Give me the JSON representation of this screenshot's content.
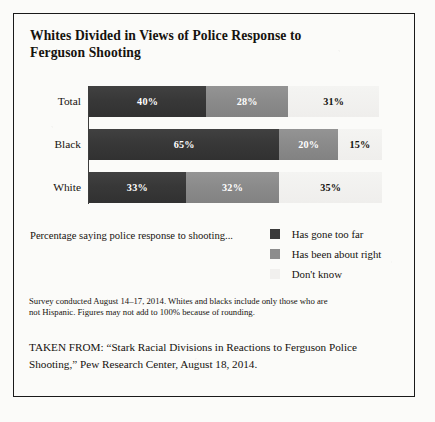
{
  "figure": {
    "title_line1": "Whites Divided in Views of Police Response to",
    "title_line2": "Ferguson Shooting"
  },
  "legend": {
    "caption": "Percentage saying police response to shooting...",
    "items": [
      {
        "label": "Has gone too far",
        "swatch": "dark-gray-swatch-icon",
        "color": "#3a3a3a"
      },
      {
        "label": "Has been about right",
        "swatch": "mid-gray-swatch-icon",
        "color": "#8d8d8d"
      },
      {
        "label": "Don't know",
        "swatch": "light-gray-swatch-icon",
        "color": "#f1f0ee"
      }
    ]
  },
  "notes": {
    "survey_line1": "Survey conducted August 14–17, 2014. Whites and blacks include only those who are",
    "survey_line2": "not Hispanic. Figures may not add to 100% because of rounding.",
    "taken_from_line1": "TAKEN FROM: “Stark Racial Divisions in Reactions to Ferguson Police",
    "taken_from_line2": "Shooting,” Pew Research Center, August 18, 2014."
  },
  "chart_data": {
    "type": "bar",
    "orientation": "horizontal",
    "stacked": true,
    "title": "Whites Divided in Views of Police Response to Ferguson Shooting",
    "xlabel": "",
    "ylabel": "",
    "xlim": [
      0,
      100
    ],
    "grid": false,
    "legend_position": "bottom-right",
    "categories": [
      "Total",
      "Black",
      "White"
    ],
    "series": [
      {
        "name": "Has gone too far",
        "color": "#3a3a3a",
        "values": [
          40,
          65,
          33
        ],
        "labels": [
          "40%",
          "65%",
          "33%"
        ]
      },
      {
        "name": "Has been about right",
        "color": "#8d8d8d",
        "values": [
          28,
          20,
          32
        ],
        "labels": [
          "28%",
          "20%",
          "32%"
        ]
      },
      {
        "name": "Don't know",
        "color": "#f1f0ee",
        "values": [
          31,
          15,
          35
        ],
        "labels": [
          "31%",
          "15%",
          "35%"
        ]
      }
    ],
    "rows": [
      {
        "category": "Total",
        "segments": [
          {
            "series": "Has gone too far",
            "value": 40,
            "label": "40%"
          },
          {
            "series": "Has been about right",
            "value": 28,
            "label": "28%"
          },
          {
            "series": "Don't know",
            "value": 31,
            "label": "31%"
          }
        ]
      },
      {
        "category": "Black",
        "segments": [
          {
            "series": "Has gone too far",
            "value": 65,
            "label": "65%"
          },
          {
            "series": "Has been about right",
            "value": 20,
            "label": "20%"
          },
          {
            "series": "Don't know",
            "value": 15,
            "label": "15%"
          }
        ]
      },
      {
        "category": "White",
        "segments": [
          {
            "series": "Has gone too far",
            "value": 33,
            "label": "33%"
          },
          {
            "series": "Has been about right",
            "value": 32,
            "label": "32%"
          },
          {
            "series": "Don't know",
            "value": 35,
            "label": "35%"
          }
        ]
      }
    ]
  }
}
